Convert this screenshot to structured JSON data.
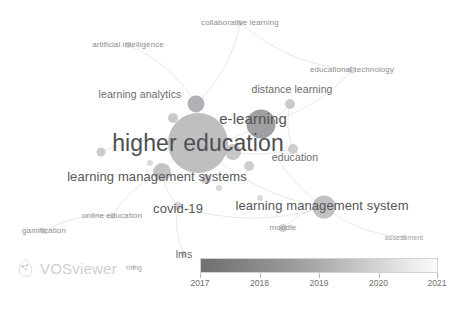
{
  "app": {
    "name": "VOSviewer",
    "logo_wordmark": "VOSviewer",
    "logo_mark_icon": "vosviewer-logo-icon"
  },
  "chart_data": {
    "type": "scatter",
    "title": "",
    "subtitle": "",
    "xlabel": "",
    "ylabel": "",
    "grid": false,
    "legend_position": "bottom-center",
    "color_scale": {
      "title": "",
      "min": 2017,
      "max": 2021,
      "ticks": [
        "2017",
        "2018",
        "2019",
        "2020",
        "2021"
      ],
      "low_color": "#6f6f71",
      "high_color": "#fbfbfc"
    },
    "nodes": [
      {
        "label": "higher education",
        "x": 198,
        "y": 143,
        "r": 30,
        "color": "#b4b4b7",
        "font": "label-xxl",
        "label_x": 198,
        "label_y": 143
      },
      {
        "label": "e-learning",
        "x": 261,
        "y": 124,
        "r": 14.5,
        "color": "#8f8f93",
        "font": "label-xl",
        "label_x": 253,
        "label_y": 118
      },
      {
        "label": "learning management system",
        "x": 324,
        "y": 207,
        "r": 11.5,
        "color": "#b6b6b9",
        "font": "label-lg",
        "label_x": 322,
        "label_y": 205
      },
      {
        "label": "learning management systems",
        "x": 162,
        "y": 172,
        "r": 9,
        "color": "#b9b9bc",
        "font": "label-lg",
        "label_x": 157,
        "label_y": 176
      },
      {
        "label": "covid-19",
        "x": 178,
        "y": 206,
        "r": 4,
        "color": "#c9c9cc",
        "font": "label-lg",
        "label_x": 178,
        "label_y": 208
      },
      {
        "label": "learning analytics",
        "x": 196,
        "y": 104,
        "r": 8.5,
        "color": "#a5a5a9",
        "font": "label-md",
        "label_x": 140,
        "label_y": 94
      },
      {
        "label": "distance learning",
        "x": 290,
        "y": 104,
        "r": 5,
        "color": "#c2c2c5",
        "font": "label-md",
        "label_x": 292,
        "label_y": 89
      },
      {
        "label": "education",
        "x": 293,
        "y": 149,
        "r": 5,
        "color": "#c6c6c9",
        "font": "label-md",
        "label_x": 295,
        "label_y": 157
      },
      {
        "label": "educational technology",
        "x": 352,
        "y": 70,
        "r": 3.5,
        "color": "#d4d4d7",
        "font": "label-sm",
        "label_x": 352,
        "label_y": 70
      },
      {
        "label": "collaborative learning",
        "x": 240,
        "y": 23,
        "r": 3,
        "color": "#d6d6d9",
        "font": "label-sm",
        "label_x": 240,
        "label_y": 23
      },
      {
        "label": "artificial intelligence",
        "x": 128,
        "y": 45,
        "r": 3,
        "color": "#d6d6d9",
        "font": "label-sm",
        "label_x": 128,
        "label_y": 45
      },
      {
        "label": "online education",
        "x": 112,
        "y": 216,
        "r": 3,
        "color": "#d8d8db",
        "font": "label-sm",
        "label_x": 112,
        "label_y": 216
      },
      {
        "label": "gamification",
        "x": 44,
        "y": 231,
        "r": 3,
        "color": "#d8d8db",
        "font": "label-sm",
        "label_x": 44,
        "label_y": 231
      },
      {
        "label": "moodle",
        "x": 283,
        "y": 228,
        "r": 4,
        "color": "#c9c9cc",
        "font": "label-sm",
        "label_x": 283,
        "label_y": 228
      },
      {
        "label": "assessment",
        "x": 404,
        "y": 237,
        "r": 2.5,
        "color": "#dadadd",
        "font": "label-xs",
        "label_x": 404,
        "label_y": 237
      },
      {
        "label": "lms",
        "x": 184,
        "y": 254,
        "r": 3,
        "color": "#cbcbce",
        "font": "label-md",
        "label_x": 184,
        "label_y": 254
      },
      {
        "label": "rning",
        "x": 134,
        "y": 267,
        "r": 2,
        "color": "#dcdcdf",
        "font": "label-xs",
        "label_x": 134,
        "label_y": 267
      }
    ],
    "extra_nodes": [
      {
        "x": 101,
        "y": 152,
        "r": 4.5,
        "color": "#c4c4c7"
      },
      {
        "x": 233,
        "y": 152,
        "r": 8,
        "color": "#bdbdc0"
      },
      {
        "x": 249,
        "y": 166,
        "r": 5,
        "color": "#c6c6c9"
      },
      {
        "x": 173,
        "y": 118,
        "r": 5,
        "color": "#c0c0c3"
      },
      {
        "x": 206,
        "y": 179,
        "r": 5,
        "color": "#c2c2c5"
      },
      {
        "x": 219,
        "y": 188,
        "r": 3,
        "color": "#d0d0d3"
      },
      {
        "x": 260,
        "y": 198,
        "r": 3,
        "color": "#d4d4d7"
      },
      {
        "x": 150,
        "y": 163,
        "r": 3,
        "color": "#d2d2d5"
      }
    ],
    "links": [
      {
        "x1": 198,
        "y1": 143,
        "x2": 261,
        "y2": 124
      },
      {
        "x1": 198,
        "y1": 143,
        "x2": 196,
        "y2": 104
      },
      {
        "x1": 198,
        "y1": 143,
        "x2": 162,
        "y2": 172
      },
      {
        "x1": 198,
        "y1": 143,
        "x2": 324,
        "y2": 207
      },
      {
        "x1": 198,
        "y1": 143,
        "x2": 293,
        "y2": 149
      },
      {
        "x1": 198,
        "y1": 143,
        "x2": 101,
        "y2": 152
      },
      {
        "x1": 196,
        "y1": 104,
        "x2": 240,
        "y2": 23
      },
      {
        "x1": 196,
        "y1": 104,
        "x2": 128,
        "y2": 45
      },
      {
        "x1": 261,
        "y1": 124,
        "x2": 290,
        "y2": 104
      },
      {
        "x1": 261,
        "y1": 124,
        "x2": 352,
        "y2": 70
      },
      {
        "x1": 261,
        "y1": 124,
        "x2": 324,
        "y2": 207
      },
      {
        "x1": 162,
        "y1": 172,
        "x2": 178,
        "y2": 206
      },
      {
        "x1": 178,
        "y1": 206,
        "x2": 324,
        "y2": 207
      },
      {
        "x1": 178,
        "y1": 206,
        "x2": 184,
        "y2": 254
      },
      {
        "x1": 324,
        "y1": 207,
        "x2": 283,
        "y2": 228
      },
      {
        "x1": 324,
        "y1": 207,
        "x2": 404,
        "y2": 237
      },
      {
        "x1": 162,
        "y1": 172,
        "x2": 112,
        "y2": 216
      },
      {
        "x1": 112,
        "y1": 216,
        "x2": 44,
        "y2": 231
      },
      {
        "x1": 240,
        "y1": 23,
        "x2": 352,
        "y2": 70
      },
      {
        "x1": 290,
        "y1": 104,
        "x2": 293,
        "y2": 149
      }
    ]
  }
}
